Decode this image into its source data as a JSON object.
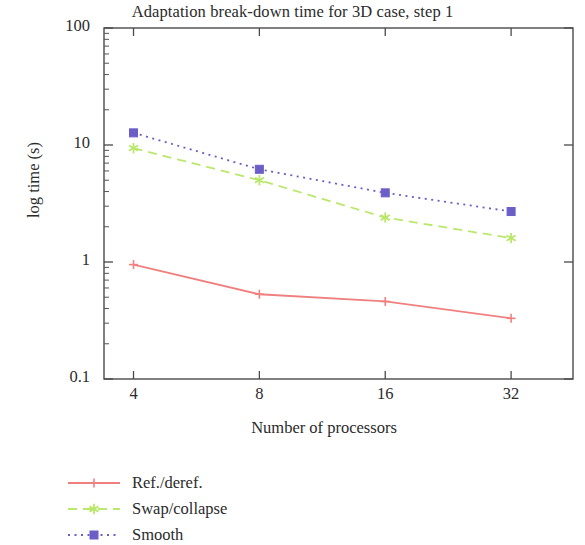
{
  "chart_data": {
    "type": "line",
    "title": "Adaptation break-down time for 3D case, step 1",
    "xlabel": "Number of processors",
    "ylabel": "log time (s)",
    "xscale": "log",
    "yscale": "log",
    "x": [
      4,
      8,
      16,
      32
    ],
    "xticklabels": [
      "4",
      "8",
      "16",
      "32"
    ],
    "yticklabels": [
      "100",
      "10",
      "1",
      "0.1"
    ],
    "ytickvalues": [
      100,
      10,
      1,
      0.1
    ],
    "xlim": [
      3.4,
      45
    ],
    "ylim": [
      0.1,
      100
    ],
    "grid": false,
    "legend_position": "below-left",
    "series": [
      {
        "name": "Ref./deref.",
        "color": "#f08080",
        "linestyle": "solid",
        "marker": "plus",
        "values": [
          0.95,
          0.53,
          0.46,
          0.33
        ]
      },
      {
        "name": "Swap/collapse",
        "color": "#b9e86a",
        "linestyle": "dashed",
        "marker": "star",
        "values": [
          9.4,
          5.0,
          2.4,
          1.6
        ]
      },
      {
        "name": "Smooth",
        "color": "#6b5fc7",
        "linestyle": "dotted",
        "marker": "square",
        "values": [
          12.7,
          6.2,
          3.9,
          2.7
        ]
      }
    ]
  },
  "legend": {
    "items": [
      {
        "label": "Ref./deref."
      },
      {
        "label": "Swap/collapse"
      },
      {
        "label": "Smooth"
      }
    ]
  }
}
